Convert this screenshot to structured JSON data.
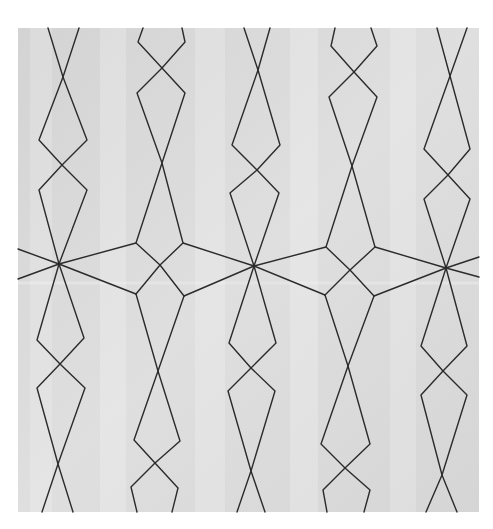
{
  "image": {
    "description": "Photograph of a light grey quilted fabric square with dark machine-stitched geometric pattern: five vertical columns of elongated diamond / hourglass chains joined across the middle by a horizontal band of star intersections.",
    "width": 493,
    "height": 529,
    "background": "#ffffff",
    "fabric": {
      "x": 18,
      "y": 28,
      "width": 461,
      "height": 484,
      "base_color": "#d9d9d9",
      "highlight_color": "#e6e6e6",
      "shadow_color": "#c4c4c4",
      "fold_line_y": 283
    },
    "stitch": {
      "color": "#2b2b2b",
      "width": 1.4
    }
  },
  "stitch_paths": [
    {
      "name": "col1-top-left",
      "points": [
        [
          48,
          28
        ],
        [
          63,
          77
        ],
        [
          87,
          140
        ],
        [
          62,
          165
        ],
        [
          39,
          190
        ],
        [
          59,
          264
        ]
      ]
    },
    {
      "name": "col1-top-right",
      "points": [
        [
          79,
          28
        ],
        [
          63,
          77
        ],
        [
          39,
          140
        ],
        [
          62,
          165
        ],
        [
          87,
          190
        ],
        [
          59,
          264
        ]
      ]
    },
    {
      "name": "col1-bot-left",
      "points": [
        [
          59,
          264
        ],
        [
          84,
          338
        ],
        [
          60,
          364
        ],
        [
          37,
          388
        ],
        [
          58,
          464
        ],
        [
          73,
          512
        ]
      ]
    },
    {
      "name": "col1-bot-right",
      "points": [
        [
          59,
          264
        ],
        [
          37,
          340
        ],
        [
          60,
          364
        ],
        [
          85,
          388
        ],
        [
          58,
          464
        ],
        [
          42,
          512
        ]
      ]
    },
    {
      "name": "col2-top-left",
      "points": [
        [
          143,
          28
        ],
        [
          138,
          42
        ],
        [
          162,
          68
        ],
        [
          185,
          93
        ],
        [
          162,
          163
        ],
        [
          136,
          243
        ],
        [
          160,
          265
        ],
        [
          184,
          296
        ]
      ]
    },
    {
      "name": "col2-top-right",
      "points": [
        [
          182,
          28
        ],
        [
          185,
          42
        ],
        [
          162,
          68
        ],
        [
          137,
          93
        ],
        [
          162,
          163
        ],
        [
          183,
          243
        ],
        [
          160,
          265
        ],
        [
          136,
          294
        ]
      ]
    },
    {
      "name": "col2-bot-left",
      "points": [
        [
          136,
          294
        ],
        [
          158,
          371
        ],
        [
          180,
          441
        ],
        [
          155,
          463
        ],
        [
          131,
          487
        ],
        [
          137,
          512
        ]
      ]
    },
    {
      "name": "col2-bot-right",
      "points": [
        [
          184,
          296
        ],
        [
          158,
          371
        ],
        [
          134,
          440
        ],
        [
          155,
          463
        ],
        [
          178,
          488
        ],
        [
          172,
          512
        ]
      ]
    },
    {
      "name": "col3-top-left",
      "points": [
        [
          244,
          28
        ],
        [
          258,
          70
        ],
        [
          280,
          145
        ],
        [
          257,
          170
        ],
        [
          230,
          193
        ],
        [
          254,
          266
        ]
      ]
    },
    {
      "name": "col3-top-right",
      "points": [
        [
          270,
          28
        ],
        [
          258,
          70
        ],
        [
          232,
          145
        ],
        [
          257,
          170
        ],
        [
          279,
          193
        ],
        [
          254,
          266
        ]
      ]
    },
    {
      "name": "col3-bot-left",
      "points": [
        [
          254,
          266
        ],
        [
          276,
          343
        ],
        [
          251,
          368
        ],
        [
          228,
          391
        ],
        [
          251,
          471
        ],
        [
          265,
          512
        ]
      ]
    },
    {
      "name": "col3-bot-right",
      "points": [
        [
          254,
          266
        ],
        [
          229,
          343
        ],
        [
          251,
          368
        ],
        [
          275,
          391
        ],
        [
          251,
          471
        ],
        [
          237,
          512
        ]
      ]
    },
    {
      "name": "col4-top-left",
      "points": [
        [
          335,
          28
        ],
        [
          331,
          46
        ],
        [
          354,
          72
        ],
        [
          377,
          97
        ],
        [
          352,
          166
        ],
        [
          326,
          247
        ],
        [
          350,
          270
        ],
        [
          374,
          296
        ]
      ]
    },
    {
      "name": "col4-top-right",
      "points": [
        [
          371,
          28
        ],
        [
          377,
          46
        ],
        [
          354,
          72
        ],
        [
          329,
          97
        ],
        [
          352,
          166
        ],
        [
          375,
          247
        ],
        [
          350,
          270
        ],
        [
          325,
          295
        ]
      ]
    },
    {
      "name": "col4-bot-left",
      "points": [
        [
          325,
          295
        ],
        [
          348,
          366
        ],
        [
          370,
          444
        ],
        [
          345,
          468
        ],
        [
          323,
          490
        ],
        [
          327,
          512
        ]
      ]
    },
    {
      "name": "col4-bot-right",
      "points": [
        [
          374,
          296
        ],
        [
          348,
          366
        ],
        [
          321,
          444
        ],
        [
          345,
          468
        ],
        [
          370,
          490
        ],
        [
          364,
          512
        ]
      ]
    },
    {
      "name": "col5-top-left",
      "points": [
        [
          437,
          28
        ],
        [
          450,
          76
        ],
        [
          470,
          149
        ],
        [
          448,
          175
        ],
        [
          424,
          199
        ],
        [
          446,
          268
        ]
      ]
    },
    {
      "name": "col5-top-right",
      "points": [
        [
          467,
          28
        ],
        [
          450,
          76
        ],
        [
          424,
          149
        ],
        [
          448,
          175
        ],
        [
          470,
          199
        ],
        [
          446,
          268
        ]
      ]
    },
    {
      "name": "col5-bot-left",
      "points": [
        [
          446,
          268
        ],
        [
          467,
          346
        ],
        [
          443,
          371
        ],
        [
          421,
          395
        ],
        [
          442,
          475
        ],
        [
          457,
          512
        ]
      ]
    },
    {
      "name": "col5-bot-right",
      "points": [
        [
          446,
          268
        ],
        [
          421,
          346
        ],
        [
          443,
          371
        ],
        [
          467,
          395
        ],
        [
          442,
          475
        ],
        [
          426,
          512
        ]
      ]
    },
    {
      "name": "band-left-edge-upper",
      "points": [
        [
          18,
          249
        ],
        [
          59,
          264
        ]
      ]
    },
    {
      "name": "band-left-edge-lower",
      "points": [
        [
          18,
          279
        ],
        [
          59,
          264
        ]
      ]
    },
    {
      "name": "band-star1-col2-upper",
      "points": [
        [
          59,
          264
        ],
        [
          136,
          243
        ]
      ]
    },
    {
      "name": "band-star1-col2-lower",
      "points": [
        [
          59,
          264
        ],
        [
          136,
          294
        ]
      ]
    },
    {
      "name": "band-col2-star3-upper",
      "points": [
        [
          183,
          243
        ],
        [
          254,
          266
        ]
      ]
    },
    {
      "name": "band-col2-star3-lower",
      "points": [
        [
          184,
          296
        ],
        [
          254,
          266
        ]
      ]
    },
    {
      "name": "band-star3-col4-upper",
      "points": [
        [
          254,
          266
        ],
        [
          326,
          247
        ]
      ]
    },
    {
      "name": "band-star3-col4-lower",
      "points": [
        [
          254,
          266
        ],
        [
          325,
          295
        ]
      ]
    },
    {
      "name": "band-col4-star5-upper",
      "points": [
        [
          375,
          247
        ],
        [
          446,
          268
        ]
      ]
    },
    {
      "name": "band-col4-star5-lower",
      "points": [
        [
          374,
          296
        ],
        [
          446,
          268
        ]
      ]
    },
    {
      "name": "band-right-edge-upper",
      "points": [
        [
          446,
          268
        ],
        [
          479,
          257
        ]
      ]
    },
    {
      "name": "band-right-edge-lower",
      "points": [
        [
          446,
          268
        ],
        [
          479,
          277
        ]
      ]
    }
  ],
  "vertical_sheen_bands": [
    {
      "x": 30,
      "width": 22,
      "opacity": 0.18
    },
    {
      "x": 100,
      "width": 26,
      "opacity": 0.22
    },
    {
      "x": 195,
      "width": 30,
      "opacity": 0.2
    },
    {
      "x": 290,
      "width": 28,
      "opacity": 0.22
    },
    {
      "x": 390,
      "width": 26,
      "opacity": 0.2
    }
  ]
}
